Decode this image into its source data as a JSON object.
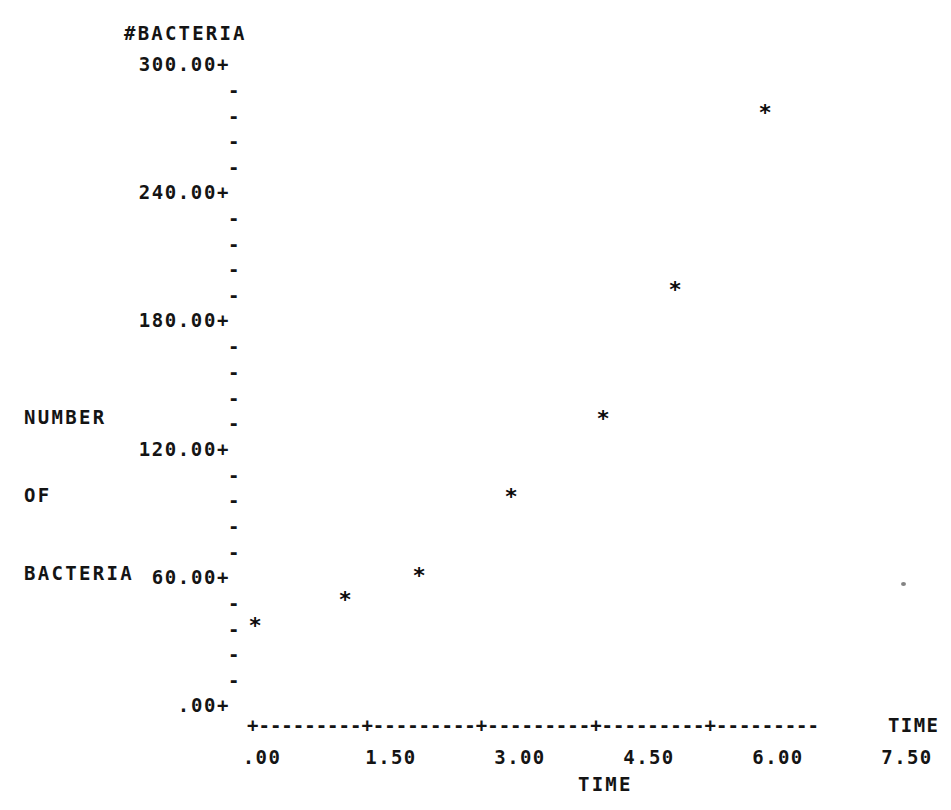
{
  "header": {
    "y_variable_name": "#BACTERIA"
  },
  "axes": {
    "y_title_lines": [
      "NUMBER",
      "OF",
      "BACTERIA"
    ],
    "x_title": "TIME",
    "x_axis_variable_label": "TIME",
    "y_major_labels": [
      "300.00+",
      "240.00+",
      "180.00+",
      "120.00+",
      "60.00+",
      ".00+"
    ],
    "y_minor_tick_glyph": "-",
    "x_labels": [
      ".00",
      "1.50",
      "3.00",
      "4.50",
      "6.00",
      "7.50"
    ],
    "x_axis_line": "+---------+---------+---------+---------+---------"
  },
  "chart_data": {
    "type": "scatter",
    "title": "#BACTERIA",
    "xlabel": "TIME",
    "ylabel": "NUMBER OF BACTERIA",
    "marker": "*",
    "grid": false,
    "legend": "none",
    "xlim": [
      0,
      8.1
    ],
    "ylim": [
      0,
      300
    ],
    "xticks": [
      0.0,
      1.5,
      3.0,
      4.5,
      6.0,
      7.5
    ],
    "ytk_major": [
      0,
      60,
      120,
      180,
      240,
      300
    ],
    "y_minor_per_major": 4,
    "x": [
      0.0,
      1.05,
      1.9,
      3.0,
      4.05,
      4.9,
      5.95
    ],
    "y": [
      37,
      49,
      60,
      98,
      134,
      194,
      277
    ],
    "points": [
      {
        "x": 0.0,
        "y": 37,
        "px": 255,
        "py": 626
      },
      {
        "x": 1.05,
        "y": 49,
        "px": 345,
        "py": 600
      },
      {
        "x": 1.9,
        "y": 60,
        "px": 419,
        "py": 576
      },
      {
        "x": 3.0,
        "y": 98,
        "px": 511,
        "py": 497
      },
      {
        "x": 4.05,
        "y": 134,
        "px": 603,
        "py": 419
      },
      {
        "x": 4.9,
        "y": 194,
        "px": 675,
        "py": 290
      },
      {
        "x": 5.95,
        "y": 277,
        "px": 765,
        "py": 113
      }
    ]
  },
  "layout": {
    "y_major_positions_px": [
      64,
      192,
      320,
      449,
      577,
      705
    ],
    "y_minor_positions_px": [
      90,
      116,
      141,
      167,
      218,
      244,
      269,
      295,
      346,
      372,
      398,
      423,
      475,
      500,
      526,
      552,
      603,
      629,
      654,
      680
    ],
    "x_tick_positions_px": [
      255,
      384,
      513,
      642,
      771,
      900
    ],
    "colors": {
      "ink": "#141414",
      "background": "#ffffff",
      "marker": "#0c0c0c"
    }
  }
}
